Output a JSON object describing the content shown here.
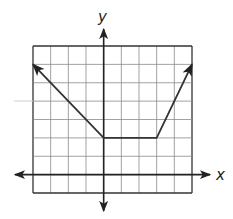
{
  "chart_data": {
    "type": "line",
    "title": "",
    "xlabel": "x",
    "ylabel": "y",
    "xlim": [
      -4,
      5
    ],
    "ylim": [
      -1,
      7
    ],
    "grid": true,
    "grid_step": 1,
    "tick_labels": false,
    "series": [
      {
        "name": "piecewise function",
        "points": [
          [
            -4,
            6
          ],
          [
            0,
            2
          ],
          [
            3,
            2
          ],
          [
            5,
            6
          ]
        ],
        "left_arrow": true,
        "right_arrow": true
      }
    ],
    "segments": [
      {
        "from": [
          -4,
          6
        ],
        "to": [
          0,
          2
        ],
        "slope": -1
      },
      {
        "from": [
          0,
          2
        ],
        "to": [
          3,
          2
        ],
        "slope": 0
      },
      {
        "from": [
          3,
          2
        ],
        "to": [
          5,
          6
        ],
        "slope": 2
      }
    ]
  },
  "labels": {
    "x": "x",
    "y": "y"
  },
  "colors": {
    "grid": "#8a8a8a",
    "axis": "#222222",
    "line": "#333333"
  }
}
